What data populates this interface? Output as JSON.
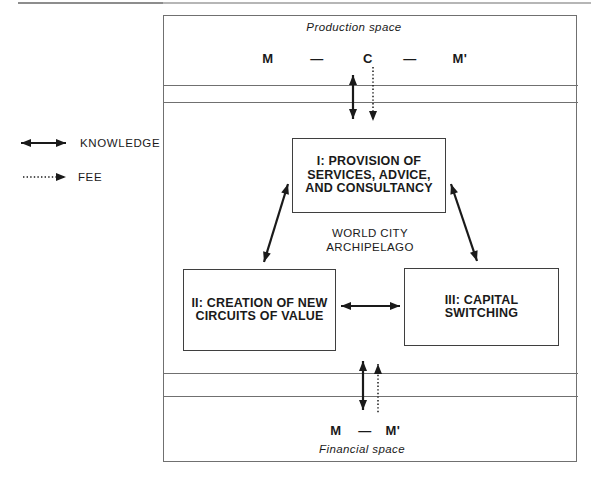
{
  "colors": {
    "ink": "#1a1a1a",
    "line": "#707070",
    "box_border": "#3f3f3f",
    "bg": "#ffffff"
  },
  "legend": {
    "knowledge_label": "KNOWLEDGE",
    "fee_label": "FEE"
  },
  "production_space": {
    "label": "Production space",
    "formula_tokens": [
      "M",
      "—",
      "C",
      "—",
      "M'"
    ]
  },
  "world_city": {
    "line1": "WORLD CITY",
    "line2": "ARCHIPELAGO"
  },
  "boxes": {
    "box_i": {
      "lines": [
        "I: PROVISION OF",
        "SERVICES, ADVICE,",
        "AND CONSULTANCY"
      ]
    },
    "box_ii": {
      "lines": [
        "II: CREATION OF NEW",
        "CIRCUITS OF VALUE"
      ]
    },
    "box_iii": {
      "lines": [
        "III: CAPITAL",
        "SWITCHING"
      ]
    }
  },
  "financial_space": {
    "label": "Financial space",
    "formula_tokens": [
      "M",
      "—",
      "M'"
    ]
  }
}
